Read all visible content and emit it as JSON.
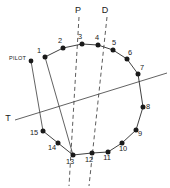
{
  "figure": {
    "title": "",
    "background_color": "#ffffff",
    "line_color": "#2b2b2b",
    "marker_color": "#1a1a1a",
    "width": 170,
    "height": 188
  },
  "chart_data": {
    "type": "scatter",
    "title": "",
    "xlabel": "",
    "ylabel": "",
    "xlim": [
      0,
      170
    ],
    "ylim": [
      0,
      188
    ],
    "grid": false,
    "legend": "none",
    "categories": [
      "1",
      "2",
      "3",
      "4",
      "5",
      "6",
      "7",
      "8",
      "9",
      "10",
      "11",
      "12",
      "13",
      "14",
      "15"
    ],
    "points": [
      {
        "label": "1",
        "x": 45,
        "y": 57,
        "label_dx": -6,
        "label_dy": -4
      },
      {
        "label": "2",
        "x": 63,
        "y": 48,
        "label_dx": -3,
        "label_dy": -5
      },
      {
        "label": "3",
        "x": 82,
        "y": 44,
        "label_dx": -2,
        "label_dy": -5
      },
      {
        "label": "4",
        "x": 98,
        "y": 45,
        "label_dx": -1,
        "label_dy": -5
      },
      {
        "label": "5",
        "x": 113,
        "y": 50,
        "label_dx": 1,
        "label_dy": -5
      },
      {
        "label": "6",
        "x": 127,
        "y": 59,
        "label_dx": 3,
        "label_dy": -4
      },
      {
        "label": "7",
        "x": 138,
        "y": 74,
        "label_dx": 4,
        "label_dy": -4
      },
      {
        "label": "8",
        "x": 143,
        "y": 107,
        "label_dx": 5,
        "label_dy": 2
      },
      {
        "label": "9",
        "x": 136,
        "y": 130,
        "label_dx": 4,
        "label_dy": 6
      },
      {
        "label": "10",
        "x": 122,
        "y": 143,
        "label_dx": 1,
        "label_dy": 8
      },
      {
        "label": "11",
        "x": 108,
        "y": 152,
        "label_dx": -1,
        "label_dy": 8
      },
      {
        "label": "12",
        "x": 92,
        "y": 153,
        "label_dx": -3,
        "label_dy": 9
      },
      {
        "label": "13",
        "x": 73,
        "y": 155,
        "label_dx": -3,
        "label_dy": 9
      },
      {
        "label": "14",
        "x": 58,
        "y": 143,
        "label_dx": -6,
        "label_dy": 7
      },
      {
        "label": "15",
        "x": 43,
        "y": 131,
        "label_dx": -9,
        "label_dy": 4
      }
    ],
    "chain_order": [
      "1",
      "2",
      "3",
      "4",
      "5",
      "6",
      "7",
      "8",
      "9",
      "10",
      "11",
      "12"
    ],
    "chain_order_lower": [
      "13",
      "14",
      "15"
    ],
    "annotations": [
      {
        "name": "pilot",
        "label": "PILOT",
        "x": 31,
        "y": 61,
        "label_x": 9,
        "label_y": 60
      },
      {
        "name": "axis-p",
        "label": "P",
        "x": 78,
        "y": 10
      },
      {
        "name": "axis-d",
        "label": "D",
        "x": 105,
        "y": 10
      },
      {
        "name": "axis-t",
        "label": "T",
        "x": 8,
        "y": 118
      }
    ]
  },
  "markers": {
    "pilot": {
      "label": "PILOT",
      "dot_x": 31,
      "dot_y": 61,
      "label_x": 9,
      "label_y": 60,
      "leader_to_x": 43,
      "leader_to_y": 131
    }
  },
  "reference_lines": {
    "p": {
      "label": "P",
      "label_x": 78,
      "label_y": 10,
      "style": "dashed",
      "from_x": 79,
      "from_y": 17,
      "to_x": 69,
      "to_y": 186
    },
    "d": {
      "label": "D",
      "label_x": 105,
      "label_y": 10,
      "style": "dashed",
      "from_x": 107,
      "from_y": 17,
      "to_x": 89,
      "to_y": 186
    },
    "t": {
      "label": "T",
      "label_x": 8,
      "label_y": 118,
      "style": "solid",
      "from_x": 15,
      "from_y": 120,
      "to_x": 167,
      "to_y": 73
    }
  },
  "connectors": {
    "pilot_to_15": {
      "from_x": 31,
      "from_y": 61,
      "to_x": 43,
      "to_y": 131
    },
    "p1_to_p13": {
      "from_x": 45,
      "from_y": 57,
      "to_x": 73,
      "to_y": 155
    }
  }
}
